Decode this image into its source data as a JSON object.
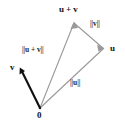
{
  "figure": {
    "background_color": "#ffffff",
    "triangle_stroke_color": "#999999",
    "vector_v_stroke_color": "#111111",
    "label_color": "#1a1a1a",
    "points": {
      "origin": {
        "label": "0",
        "x": 40,
        "y": 108
      },
      "u": {
        "label": "u",
        "x": 103,
        "y": 48
      },
      "u_plus_v": {
        "label": "u + v",
        "x": 74,
        "y": 22
      },
      "v": {
        "label": "v",
        "x": 20,
        "y": 69
      }
    },
    "edge_labels": {
      "norm_u": "||u||",
      "norm_v": "||v||",
      "norm_u_plus_v": "||u + v||"
    }
  }
}
